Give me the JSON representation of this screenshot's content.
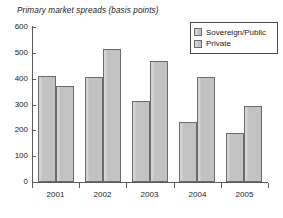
{
  "chart_data": {
    "type": "bar",
    "title": "Primary market spreads (basis points)",
    "xlabel": "",
    "ylabel": "",
    "categories": [
      "2001",
      "2002",
      "2003",
      "2004",
      "2005"
    ],
    "series": [
      {
        "name": "Sovereign/Public",
        "values": [
          412,
          405,
          315,
          233,
          188
        ],
        "color": "#c2c2c2"
      },
      {
        "name": "Private",
        "values": [
          372,
          513,
          468,
          405,
          296
        ],
        "color": "#c2c2c2"
      }
    ],
    "ylim": [
      0,
      600
    ],
    "yticks": [
      0,
      100,
      200,
      300,
      400,
      500,
      600
    ],
    "ytick_labels": [
      "0",
      "100",
      "200",
      "300",
      "400",
      "500",
      "600"
    ],
    "grid": false,
    "legend_position": "top-right"
  },
  "legend": {
    "items": [
      {
        "label": "Sovereign/Public"
      },
      {
        "label": "Private"
      }
    ]
  }
}
